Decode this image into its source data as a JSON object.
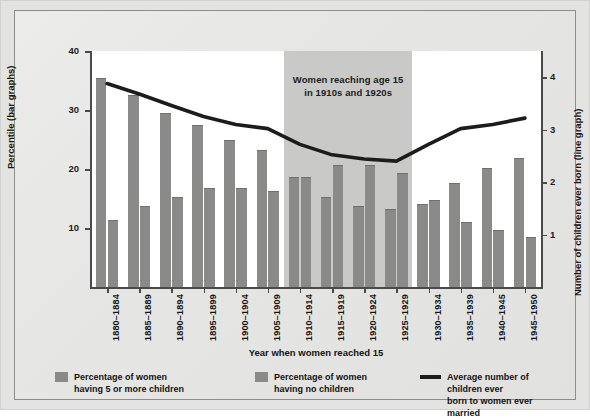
{
  "chart_data": {
    "type": "bar",
    "title": "",
    "xlabel": "Year when women reached 15",
    "ylabel": "Percentile (bar graphs)",
    "ylabel_right": "Number of children ever born (line graph)",
    "ylim": [
      0,
      40
    ],
    "ylim_right": [
      0,
      4.5
    ],
    "yticks": [
      "10",
      "20",
      "30",
      "40"
    ],
    "ytick_values": [
      10,
      20,
      30,
      40
    ],
    "yticks_right": [
      "1",
      "2",
      "3",
      "4"
    ],
    "ytick_values_right": [
      1,
      2,
      3,
      4
    ],
    "grid": false,
    "legend_position": "bottom",
    "categories": [
      "1880–1884",
      "1885–1889",
      "1890–1894",
      "1895–1899",
      "1900–1904",
      "1905–1909",
      "1910–1914",
      "1915–1919",
      "1920–1924",
      "1925–1929",
      "1930–1934",
      "1935–1939",
      "1940–1945",
      "1945–1950"
    ],
    "series": [
      {
        "name": "Percentage of women having 5 or more children",
        "kind": "bar",
        "axis": "left",
        "color": "#8a8a88",
        "values": [
          35.5,
          32.5,
          29.5,
          27.5,
          25.0,
          23.2,
          18.6,
          15.3,
          13.8,
          13.2,
          14.1,
          17.7,
          20.2,
          21.8
        ]
      },
      {
        "name": "Percentage of women having no children",
        "kind": "bar",
        "axis": "left",
        "color": "#8a8a88",
        "values": [
          11.3,
          13.7,
          15.3,
          16.7,
          16.8,
          16.3,
          18.6,
          20.6,
          20.6,
          19.3,
          14.7,
          11.1,
          9.7,
          8.5
        ]
      },
      {
        "name": "Average number of children ever born to women ever married",
        "kind": "line",
        "axis": "right",
        "color": "#1c1c1c",
        "values": [
          3.88,
          3.68,
          3.46,
          3.25,
          3.1,
          3.02,
          2.72,
          2.52,
          2.44,
          2.4,
          2.72,
          3.02,
          3.1,
          3.22
        ]
      }
    ],
    "annotation": {
      "text_line1": "Women reaching age 15",
      "text_line2": "in 1910s and 1920s",
      "spans_categories": [
        "1910–1914",
        "1925–1929"
      ],
      "band_color": "#c9c9c7"
    }
  },
  "legend": [
    {
      "marker": "bar",
      "line1": "Percentage of women",
      "line2": "having 5 or more children"
    },
    {
      "marker": "bar",
      "line1": "Percentage of women",
      "line2": "having no children"
    },
    {
      "marker": "line",
      "line1": "Average number of children ever",
      "line2": "born to women ever married"
    }
  ]
}
